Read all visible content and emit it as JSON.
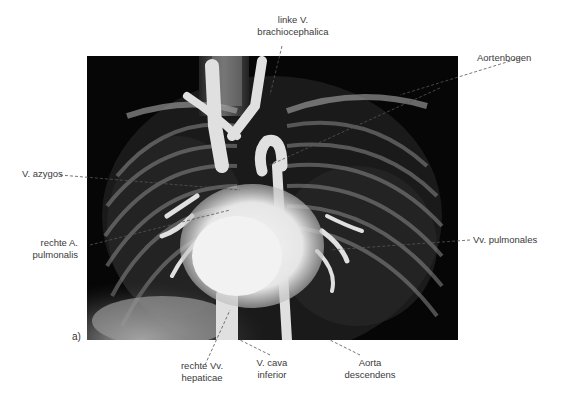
{
  "figure": {
    "panel_label": "a)",
    "image_description": "Angiographic X-ray of the thorax showing heart and great vessels",
    "labels": {
      "top": {
        "line1": "linke V.",
        "line2": "brachiocephalica"
      },
      "aortenbogen": "Aortenbogen",
      "azygos": "V. azygos",
      "rechte_a": {
        "line1": "rechte A.",
        "line2": "pulmonalis"
      },
      "vv_pulmonales": "Vv. pulmonales",
      "rechte_vv": {
        "line1": "rechte Vv.",
        "line2": "hepaticae"
      },
      "cava": {
        "line1": "V. cava",
        "line2": "inferior"
      },
      "aorta_desc": {
        "line1": "Aorta",
        "line2": "descendens"
      }
    }
  }
}
